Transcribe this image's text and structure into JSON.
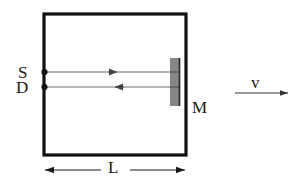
{
  "diagram": {
    "background_color": "#ffffff",
    "box": {
      "name": "cavity-box",
      "stroke_color": "#111111",
      "stroke_width": 3.2,
      "x": 44,
      "y": 14,
      "width": 142,
      "height": 141
    },
    "labels": {
      "source": "S",
      "detector": "D",
      "mirror": "M",
      "velocity": "v",
      "length": "L"
    },
    "points": [
      {
        "name": "source-point",
        "label": "S",
        "x": 44,
        "y": 72
      },
      {
        "name": "detector-point",
        "label": "D",
        "x": 44,
        "y": 87
      }
    ],
    "beams": [
      {
        "name": "outgoing-beam",
        "direction": "right",
        "from_x": 46,
        "to_x": 179,
        "y": 72,
        "arrow_x": 116,
        "color": "#666666"
      },
      {
        "name": "returning-beam",
        "direction": "left",
        "from_x": 46,
        "to_x": 179,
        "y": 87,
        "arrow_x": 116,
        "color": "#666666"
      }
    ],
    "mirror": {
      "name": "mirror-hatching",
      "x": 178,
      "top_y": 59,
      "bottom_y": 105,
      "hatch_count": 24,
      "hatch_length": 9,
      "color": "#222222"
    },
    "velocity_arrow": {
      "name": "velocity-arrow",
      "from_x": 235,
      "to_x": 289,
      "y": 93,
      "color": "#333333"
    },
    "dimension_line": {
      "name": "length-dimension",
      "from_x": 44,
      "to_x": 186,
      "y": 170,
      "gap_left": 102,
      "gap_right": 130,
      "color": "#1a1a1a"
    }
  }
}
